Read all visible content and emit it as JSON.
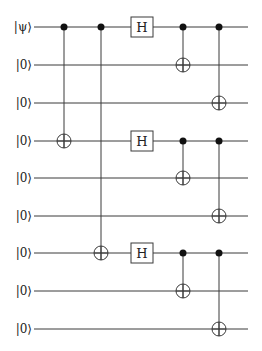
{
  "diagram": {
    "type": "quantum-circuit",
    "qubits": [
      {
        "label": "|ψ⟩",
        "y": 27
      },
      {
        "label": "|0⟩",
        "y": 65
      },
      {
        "label": "|0⟩",
        "y": 103
      },
      {
        "label": "|0⟩",
        "y": 141
      },
      {
        "label": "|0⟩",
        "y": 178
      },
      {
        "label": "|0⟩",
        "y": 216
      },
      {
        "label": "|0⟩",
        "y": 253
      },
      {
        "label": "|0⟩",
        "y": 291
      },
      {
        "label": "|0⟩",
        "y": 329
      }
    ],
    "wire_start_x": 34,
    "wire_end_x": 248,
    "gates": [
      {
        "type": "cnot",
        "x": 64,
        "control": 0,
        "target": 3
      },
      {
        "type": "cnot",
        "x": 101,
        "control": 0,
        "target": 6
      },
      {
        "type": "h",
        "x": 142,
        "qubit": 0,
        "label": "H"
      },
      {
        "type": "h",
        "x": 142,
        "qubit": 3,
        "label": "H"
      },
      {
        "type": "h",
        "x": 142,
        "qubit": 6,
        "label": "H"
      },
      {
        "type": "cnot",
        "x": 183,
        "control": 0,
        "target": 1
      },
      {
        "type": "cnot",
        "x": 219,
        "control": 0,
        "target": 2
      },
      {
        "type": "cnot",
        "x": 183,
        "control": 3,
        "target": 4
      },
      {
        "type": "cnot",
        "x": 219,
        "control": 3,
        "target": 5
      },
      {
        "type": "cnot",
        "x": 183,
        "control": 6,
        "target": 7
      },
      {
        "type": "cnot",
        "x": 219,
        "control": 6,
        "target": 8
      }
    ]
  }
}
